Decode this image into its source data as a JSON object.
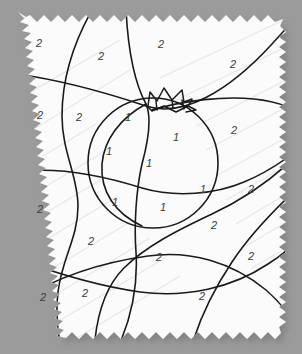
{
  "canvas": {
    "width": 302,
    "height": 354,
    "background_color": "#9b9b9b",
    "paper_color": "#fbfbfb",
    "ink_color": "#1a1a1a",
    "number_color": "#3a3a3a",
    "shadow_color": "#8d8d8d",
    "streak_color": "#e2e2e2"
  },
  "worksheet": {
    "type": "color-by-number",
    "subject": "tomato",
    "paper_edge_style": "torn-deckled",
    "palette_keys": [
      "1",
      "2"
    ]
  },
  "regions": [
    {
      "id": "r01",
      "label": "2",
      "x": 39,
      "y": 44
    },
    {
      "id": "r02",
      "label": "2",
      "x": 101,
      "y": 57
    },
    {
      "id": "r03",
      "label": "2",
      "x": 161,
      "y": 45
    },
    {
      "id": "r04",
      "label": "2",
      "x": 233,
      "y": 65
    },
    {
      "id": "r05",
      "label": "2",
      "x": 40,
      "y": 116
    },
    {
      "id": "r06",
      "label": "2",
      "x": 79,
      "y": 118
    },
    {
      "id": "r07",
      "label": "1",
      "x": 128,
      "y": 118
    },
    {
      "id": "r08",
      "label": "1",
      "x": 176,
      "y": 138
    },
    {
      "id": "r09",
      "label": "2",
      "x": 234,
      "y": 131
    },
    {
      "id": "r10",
      "label": "1",
      "x": 109,
      "y": 152
    },
    {
      "id": "r11",
      "label": "1",
      "x": 149,
      "y": 164
    },
    {
      "id": "r12",
      "label": "1",
      "x": 203,
      "y": 190
    },
    {
      "id": "r13",
      "label": "2",
      "x": 251,
      "y": 190
    },
    {
      "id": "r14",
      "label": "2",
      "x": 40,
      "y": 210
    },
    {
      "id": "r15",
      "label": "1",
      "x": 115,
      "y": 203
    },
    {
      "id": "r16",
      "label": "1",
      "x": 163,
      "y": 208
    },
    {
      "id": "r17",
      "label": "2",
      "x": 214,
      "y": 226
    },
    {
      "id": "r18",
      "label": "2",
      "x": 91,
      "y": 242
    },
    {
      "id": "r19",
      "label": "2",
      "x": 159,
      "y": 258
    },
    {
      "id": "r20",
      "label": "2",
      "x": 251,
      "y": 257
    },
    {
      "id": "r21",
      "label": "2",
      "x": 43,
      "y": 298
    },
    {
      "id": "r22",
      "label": "2",
      "x": 85,
      "y": 294
    },
    {
      "id": "r23",
      "label": "2",
      "x": 202,
      "y": 297
    }
  ],
  "strokes": {
    "fruit_circle": {
      "name": "tomato-body-circle",
      "cx": 153,
      "cy": 163,
      "r": 65
    },
    "stem": {
      "name": "tomato-stem-calyx",
      "description": "zigzag crown shape at top of fruit"
    },
    "curve_count": 9
  }
}
